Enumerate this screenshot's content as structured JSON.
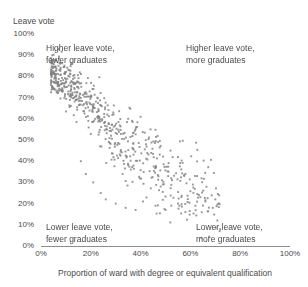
{
  "chart_data": {
    "type": "scatter",
    "title": "",
    "xlabel": "Proportion of ward with degree or equivalent qualification",
    "ylabel": "Leave vote",
    "xlim": [
      0,
      100
    ],
    "ylim": [
      0,
      100
    ],
    "grid": false,
    "legend": null,
    "xticks": [
      "0%",
      "20%",
      "40%",
      "60%",
      "80%",
      "100%"
    ],
    "xtick_values": [
      0,
      20,
      40,
      60,
      80,
      100
    ],
    "yticks": [
      "0%",
      "10%",
      "20%",
      "30%",
      "40%",
      "50%",
      "60%",
      "70%",
      "80%",
      "90%",
      "100%"
    ],
    "ytick_values": [
      0,
      10,
      20,
      30,
      40,
      50,
      60,
      70,
      80,
      90,
      100
    ],
    "marker": {
      "shape": "square",
      "color": "#808080",
      "size_px": 1.9,
      "opacity": 0.82
    },
    "point_count": 620,
    "correlation": -0.82,
    "annotations": [
      {
        "position": "top-left",
        "line1": "Higher leave vote,",
        "line2": "fewer graduates"
      },
      {
        "position": "top-right",
        "line1": "Higher leave vote,",
        "line2": "more graduates"
      },
      {
        "position": "bottom-left",
        "line1": "Lower leave vote,",
        "line2": "fewer graduates"
      },
      {
        "position": "bottom-right",
        "line1": "Lower leave vote,",
        "line2": "more graduates"
      }
    ],
    "cloud_spine": [
      {
        "x": 8,
        "y": 78
      },
      {
        "x": 14,
        "y": 72
      },
      {
        "x": 20,
        "y": 65
      },
      {
        "x": 26,
        "y": 58
      },
      {
        "x": 32,
        "y": 51
      },
      {
        "x": 38,
        "y": 45
      },
      {
        "x": 45,
        "y": 39
      },
      {
        "x": 52,
        "y": 33
      },
      {
        "x": 60,
        "y": 27
      },
      {
        "x": 68,
        "y": 22
      }
    ],
    "x_range_observed": [
      4,
      72
    ],
    "y_range_observed": [
      14,
      82
    ],
    "colors": {
      "point": "#808080",
      "axis": "#8d8d8d",
      "text": "#4a4a4a",
      "background": "#ffffff"
    }
  }
}
